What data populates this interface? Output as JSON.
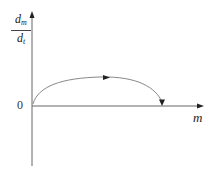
{
  "figure": {
    "top_text_fragment": "",
    "y_axis": {
      "label_numerator": "d",
      "label_numerator_sub": "m",
      "label_denominator": "d",
      "label_denominator_sub": "t"
    },
    "x_axis": {
      "label": "m"
    },
    "origin_label": "0",
    "curve": {
      "description": "Arc starting at origin, rising to a maximum, then descending back to the m-axis; arrows indicate direction of motion to the right then down to the axis",
      "start": [
        0,
        0
      ],
      "peak_relative_x": 0.5,
      "end_on_axis": true
    },
    "colors": {
      "axis": "#555555",
      "curve": "#777777",
      "arrow": "#222222",
      "text": "#222222"
    }
  }
}
